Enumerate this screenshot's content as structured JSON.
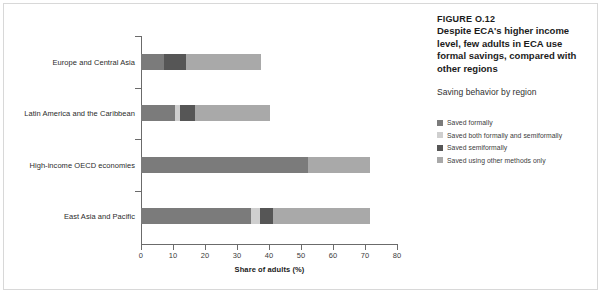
{
  "figure": {
    "number": "FIGURE O.12",
    "title": "Despite ECA's higher income level, few adults in ECA use formal savings, compared with other regions",
    "subtitle": "Saving behavior by region"
  },
  "legend": {
    "items": [
      {
        "label": "Saved formally",
        "color": "#7b7b7b"
      },
      {
        "label": "Saved both formally and semiformally",
        "color": "#cfcfcf"
      },
      {
        "label": "Saved semiformally",
        "color": "#565656"
      },
      {
        "label": "Saved using other methods only",
        "color": "#a9a9a9"
      }
    ]
  },
  "chart_data": {
    "type": "bar",
    "orientation": "horizontal",
    "stacked": true,
    "title": "Despite ECA's higher income level, few adults in ECA use formal savings, compared with other regions",
    "subtitle": "Saving behavior by region",
    "xlabel": "Share of adults (%)",
    "ylabel": "",
    "xlim": [
      0,
      80
    ],
    "xticks": [
      0,
      10,
      20,
      30,
      40,
      50,
      60,
      70,
      80
    ],
    "xticklabels": [
      "0",
      "10",
      "20",
      "30",
      "40",
      "50",
      "60",
      "70",
      "80"
    ],
    "grid": false,
    "legend_position": "right",
    "categories": [
      "Europe and Central Asia",
      "Latin America and the Caribbean",
      "High-income OECD economies",
      "East Asia and Pacific"
    ],
    "series": [
      {
        "name": "Saved formally",
        "color": "#7b7b7b",
        "values": [
          7.1,
          10.5,
          52.2,
          34.5
        ]
      },
      {
        "name": "Saved both formally and semiformally",
        "color": "#cfcfcf",
        "values": [
          0.0,
          1.6,
          0.0,
          2.6
        ]
      },
      {
        "name": "Saved semiformally",
        "color": "#565656",
        "values": [
          7.1,
          4.8,
          0.0,
          4.2
        ]
      },
      {
        "name": "Saved using other methods only",
        "color": "#a9a9a9",
        "values": [
          23.4,
          23.5,
          19.3,
          30.2
        ]
      }
    ],
    "totals": [
      37.6,
      40.4,
      71.5,
      71.5
    ]
  }
}
